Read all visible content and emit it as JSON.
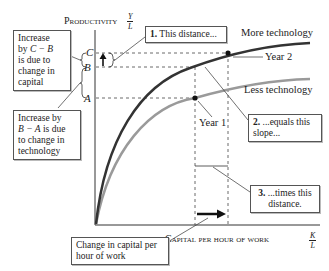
{
  "axes": {
    "y_label": "Productivity",
    "y_fraction": {
      "num": "Y",
      "den": "L"
    },
    "x_label": "Capital per hour of work",
    "x_fraction": {
      "num": "K",
      "den": "L"
    }
  },
  "tick_labels": {
    "C": "C",
    "B": "B",
    "A": "A"
  },
  "curves": {
    "more": "More technology",
    "less": "Less technology",
    "more_color": "#333333",
    "less_color": "#9a9a9a"
  },
  "points": {
    "year1": "Year 1",
    "year2": "Year 2"
  },
  "boxes": {
    "b1_num": "1.",
    "b1_text": " This distance...",
    "b2_num": "2.",
    "b2_text": " ...equals this slope...",
    "b3_num": "3.",
    "b3_text": " ...times this distance.",
    "capital_line1": "Increase",
    "capital_line2a": "by ",
    "capital_line2b": "C − B",
    "capital_line3": "is due to",
    "capital_line4": "change in",
    "capital_line5": "capital",
    "tech_line1": "Increase by",
    "tech_line2a": "B − A",
    "tech_line2b": " is due",
    "tech_line3": "to change in",
    "tech_line4": "technology",
    "change_capital": "Change in capital per hour of work"
  }
}
